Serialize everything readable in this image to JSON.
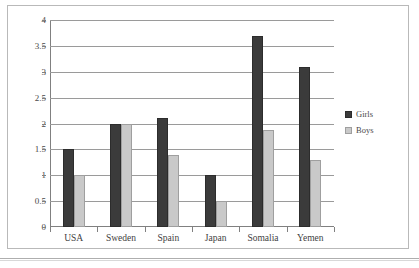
{
  "chart_data": {
    "type": "bar",
    "title": "",
    "subtitle": "",
    "xlabel": "",
    "ylabel": "",
    "categories": [
      "USA",
      "Sweden",
      "Spain",
      "Japan",
      "Somalia",
      "Yemen"
    ],
    "series": [
      {
        "name": "Girls",
        "color": "#3b3b3b",
        "values": [
          1.5,
          2.0,
          2.1,
          1.0,
          3.7,
          3.1
        ]
      },
      {
        "name": "Boys",
        "color": "#c9c9c9",
        "values": [
          1.0,
          2.0,
          1.4,
          0.5,
          1.87,
          1.3
        ]
      }
    ],
    "ylim": [
      0,
      4
    ],
    "ytick_labels": [
      "0",
      "0.5",
      "1",
      "1.5",
      "2",
      "2.5",
      "3",
      "3.5",
      "4"
    ],
    "ytick_values": [
      0,
      0.5,
      1,
      1.5,
      2,
      2.5,
      3,
      3.5,
      4
    ],
    "grid": true,
    "legend_position": "right",
    "legend_entries": [
      "Girls",
      "Boys"
    ]
  },
  "legend": {
    "entries": [
      {
        "label": "Girls",
        "swatch": "girls"
      },
      {
        "label": "Boys",
        "swatch": "boys"
      }
    ]
  }
}
